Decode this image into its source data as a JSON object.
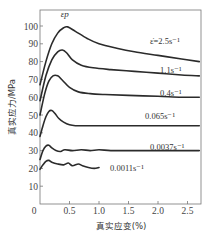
{
  "chart_data": {
    "type": "line",
    "title": "",
    "xlabel": "真实应变(%)",
    "ylabel": "真实应力/MPa",
    "xlim": [
      0,
      2.7
    ],
    "ylim": [
      0,
      105
    ],
    "xticks": [
      0,
      0.5,
      1.0,
      1.5,
      2.0,
      2.5
    ],
    "xtick_labels": [
      "0",
      "0.5",
      "1.0",
      "1.5",
      "2.0",
      "2.5"
    ],
    "yticks": [
      10,
      20,
      30,
      40,
      50,
      60,
      70,
      80,
      90,
      100
    ],
    "ytick_labels": [
      "10",
      "20",
      "30",
      "40",
      "50",
      "60",
      "70",
      "80",
      "90",
      "100"
    ],
    "origin_label": "0",
    "grid": false,
    "legend": "inline labels at right of each curve",
    "annotations": [
      {
        "text": "εp",
        "x": 0.42,
        "y": 102,
        "meaning": "peak strain marker"
      }
    ],
    "series": [
      {
        "name": "ε̇=2.5s⁻¹",
        "label": "ε̇=2.5s⁻¹",
        "x": [
          0,
          0.1,
          0.2,
          0.3,
          0.4,
          0.47,
          0.6,
          0.8,
          1.0,
          1.3,
          1.6,
          2.0,
          2.4,
          2.7
        ],
        "y": [
          67,
          80,
          90,
          96,
          99,
          99.5,
          97,
          93,
          90,
          87.5,
          85.5,
          83.5,
          81.5,
          80
        ]
      },
      {
        "name": "1.1s⁻¹",
        "label": "1.1s⁻¹",
        "x": [
          0,
          0.1,
          0.2,
          0.3,
          0.38,
          0.45,
          0.55,
          0.7,
          0.9,
          1.2,
          1.6,
          2.0,
          2.4,
          2.7
        ],
        "y": [
          58,
          72,
          81,
          85.5,
          86.5,
          85,
          81,
          78,
          76.5,
          75.5,
          74.5,
          73.5,
          72.5,
          72
        ]
      },
      {
        "name": "0.4s⁻¹",
        "label": "0.4s⁻¹",
        "x": [
          0,
          0.08,
          0.15,
          0.22,
          0.3,
          0.38,
          0.5,
          0.65,
          0.85,
          1.1,
          1.5,
          2.0,
          2.4,
          2.7
        ],
        "y": [
          50,
          62,
          69,
          72,
          72,
          69.5,
          65.5,
          63,
          62,
          61.5,
          61,
          60.5,
          60,
          60
        ]
      },
      {
        "name": "0.065s⁻¹",
        "label": "0.065s⁻¹",
        "x": [
          0,
          0.05,
          0.1,
          0.15,
          0.2,
          0.25,
          0.32,
          0.4,
          0.5,
          0.6,
          0.8,
          1.2,
          1.8,
          2.4,
          2.7
        ],
        "y": [
          38,
          44,
          49,
          52,
          52.5,
          51,
          48,
          46,
          44.5,
          44,
          44,
          44,
          44,
          44,
          44
        ]
      },
      {
        "name": "0.0037s⁻¹",
        "label": "0.0037s⁻¹",
        "x": [
          0,
          0.05,
          0.1,
          0.15,
          0.2,
          0.27,
          0.35,
          0.42,
          0.55,
          0.7,
          0.85,
          1.0,
          1.2,
          1.5,
          2.0,
          2.5,
          2.7
        ],
        "y": [
          25,
          30,
          32.5,
          33,
          31.5,
          30,
          29.5,
          30.5,
          30,
          30.5,
          30,
          30.5,
          30,
          30,
          30,
          30,
          30
        ]
      },
      {
        "name": "0.0011s⁻¹",
        "label": "0.0011s⁻¹",
        "x": [
          0,
          0.05,
          0.1,
          0.15,
          0.2,
          0.3,
          0.4,
          0.48,
          0.55,
          0.65,
          0.72,
          0.82,
          0.92,
          1.0
        ],
        "y": [
          19.5,
          22,
          24,
          24.5,
          23.5,
          22.5,
          22,
          23,
          21.5,
          22.5,
          21.5,
          20.5,
          20,
          20.5
        ]
      }
    ]
  }
}
